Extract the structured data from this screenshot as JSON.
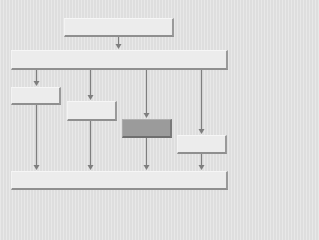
{
  "diagram": {
    "type": "flowchart",
    "background": "#e3e3e3",
    "colors": {
      "box": "#ececec",
      "box_highlight": "#9b9b9b",
      "box_edge": "#909090",
      "arrow": "#7e7e7e"
    },
    "nodes": [
      {
        "id": "top",
        "label": "",
        "x": 64,
        "y": 18,
        "w": 110,
        "h": 19,
        "highlight": false
      },
      {
        "id": "wide",
        "label": "",
        "x": 11,
        "y": 50,
        "w": 217,
        "h": 20,
        "highlight": false
      },
      {
        "id": "a",
        "label": "",
        "x": 11,
        "y": 87,
        "w": 50,
        "h": 18,
        "highlight": false
      },
      {
        "id": "b",
        "label": "",
        "x": 67,
        "y": 101,
        "w": 50,
        "h": 20,
        "highlight": false
      },
      {
        "id": "c",
        "label": "",
        "x": 122,
        "y": 119,
        "w": 50,
        "h": 19,
        "highlight": true
      },
      {
        "id": "d",
        "label": "",
        "x": 177,
        "y": 135,
        "w": 50,
        "h": 19,
        "highlight": false
      },
      {
        "id": "bottom",
        "label": "",
        "x": 11,
        "y": 171,
        "w": 217,
        "h": 19,
        "highlight": false
      }
    ],
    "edges": [
      {
        "from": "top",
        "to": "wide",
        "x": 118,
        "y1": 37,
        "y2": 50
      },
      {
        "from": "wide",
        "to": "a",
        "x": 36,
        "y1": 70,
        "y2": 87
      },
      {
        "from": "wide",
        "to": "b",
        "x": 90,
        "y1": 70,
        "y2": 101
      },
      {
        "from": "wide",
        "to": "c",
        "x": 146,
        "y1": 70,
        "y2": 119
      },
      {
        "from": "wide",
        "to": "d",
        "x": 201,
        "y1": 70,
        "y2": 135
      },
      {
        "from": "a",
        "to": "bottom",
        "x": 36,
        "y1": 105,
        "y2": 171
      },
      {
        "from": "b",
        "to": "bottom",
        "x": 90,
        "y1": 121,
        "y2": 171
      },
      {
        "from": "c",
        "to": "bottom",
        "x": 146,
        "y1": 138,
        "y2": 171
      },
      {
        "from": "d",
        "to": "bottom",
        "x": 201,
        "y1": 154,
        "y2": 171
      }
    ]
  }
}
